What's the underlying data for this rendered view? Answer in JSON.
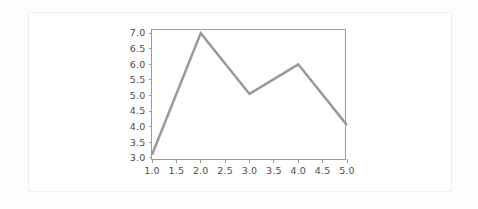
{
  "figure": {
    "background_color": "#fdfdfd",
    "card_color": "#ffffff",
    "card_border_color": "#efefef"
  },
  "chart_data": {
    "type": "line",
    "title": "",
    "subtitle": "",
    "xlabel": "",
    "ylabel": "",
    "grid": false,
    "legend": false,
    "legend_position": "none",
    "line_color": "#999999",
    "line_width": 2.5,
    "markers": false,
    "spine_color": "#9a9a9a",
    "tick_label_color": "#4d4d4d",
    "xlim": [
      1.0,
      5.0
    ],
    "ylim": [
      2.9,
      7.1
    ],
    "xticks": [
      1.0,
      1.5,
      2.0,
      2.5,
      3.0,
      3.5,
      4.0,
      4.5,
      5.0
    ],
    "xticklabels": [
      "1.0",
      "1.5",
      "2.0",
      "2.5",
      "3.0",
      "3.5",
      "4.0",
      "4.5",
      "5.0"
    ],
    "yticks": [
      3.0,
      3.5,
      4.0,
      4.5,
      5.0,
      5.5,
      6.0,
      6.5,
      7.0
    ],
    "yticklabels": [
      "3.0",
      "3.5",
      "4.0",
      "4.5",
      "5.0",
      "5.5",
      "6.0",
      "6.5",
      "7.0"
    ],
    "x": [
      1.0,
      2.0,
      3.0,
      4.0,
      5.0
    ],
    "y": [
      3.1,
      7.0,
      5.05,
      6.0,
      4.05
    ],
    "series": [
      {
        "name": "series-1",
        "x": [
          1.0,
          2.0,
          3.0,
          4.0,
          5.0
        ],
        "values": [
          3.1,
          7.0,
          5.05,
          6.0,
          4.05
        ],
        "color": "#999999"
      }
    ]
  }
}
